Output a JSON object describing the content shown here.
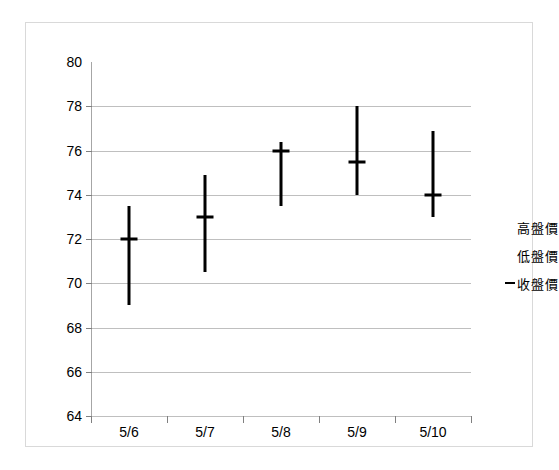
{
  "chart_data": {
    "type": "bar",
    "subtype": "high-low-close",
    "title": "",
    "subtitle": "",
    "xlabel": "",
    "ylabel": "",
    "categories": [
      "5/6",
      "5/7",
      "5/8",
      "5/9",
      "5/10"
    ],
    "series": [
      {
        "name": "高盤價",
        "values": [
          73.5,
          74.9,
          76.4,
          78.0,
          76.9
        ]
      },
      {
        "name": "低盤價",
        "values": [
          69.0,
          70.5,
          73.5,
          74.0,
          73.0
        ]
      },
      {
        "name": "收盤價",
        "values": [
          72.0,
          73.0,
          76.0,
          75.5,
          74.0
        ]
      }
    ],
    "ylim": [
      64,
      80
    ],
    "ytick_step": 2,
    "ytick_labels": [
      "80",
      "78",
      "76",
      "74",
      "72",
      "70",
      "68",
      "66",
      "64"
    ],
    "ytick_values": [
      80,
      78,
      76,
      74,
      72,
      70,
      68,
      66,
      64
    ],
    "grid": true,
    "grid_axis": "y",
    "legend_position": "right",
    "legend": [
      {
        "label": "高盤價",
        "marker": "none"
      },
      {
        "label": "低盤價",
        "marker": "none"
      },
      {
        "label": "收盤價",
        "marker": "dash"
      }
    ],
    "colors": {
      "series": "#000000",
      "gridline": "#bfbfbf",
      "axis": "#808080",
      "frame": "#d9d9d9",
      "background": "#ffffff"
    }
  }
}
